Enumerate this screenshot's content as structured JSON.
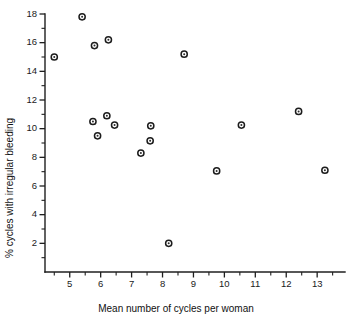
{
  "chart_data": {
    "type": "scatter",
    "title": "",
    "xlabel": "Mean number of cycles per woman",
    "ylabel": "% cycles with irregular bleeding",
    "xlim": [
      4.2,
      13.9
    ],
    "ylim": [
      0,
      18
    ],
    "grid": false,
    "legend": "none",
    "marker": "open-circle",
    "x_ticks_major": [
      5,
      6,
      7,
      8,
      9,
      10,
      11,
      12,
      13
    ],
    "x_tick_labels": [
      "5",
      "6",
      "7",
      "8",
      "9",
      "10",
      "11",
      "12",
      "13"
    ],
    "x_ticks_minor": [
      4.5,
      5.5,
      6.5,
      7.5,
      8.5,
      9.5,
      10.5,
      11.5,
      12.5,
      13.5
    ],
    "y_ticks_major": [
      2,
      4,
      6,
      8,
      10,
      12,
      14,
      16,
      18
    ],
    "y_tick_labels": [
      "2",
      "4",
      "6",
      "8",
      "10",
      "12",
      "14",
      "16",
      "18"
    ],
    "y_ticks_minor": [
      1,
      3,
      5,
      7,
      9,
      11,
      13,
      15,
      17
    ],
    "points": [
      {
        "x": 4.5,
        "y": 15.0
      },
      {
        "x": 5.4,
        "y": 17.8
      },
      {
        "x": 5.8,
        "y": 15.8
      },
      {
        "x": 6.25,
        "y": 16.2
      },
      {
        "x": 5.75,
        "y": 10.5
      },
      {
        "x": 5.9,
        "y": 9.5
      },
      {
        "x": 6.2,
        "y": 10.9
      },
      {
        "x": 6.45,
        "y": 10.25
      },
      {
        "x": 7.3,
        "y": 8.3
      },
      {
        "x": 7.6,
        "y": 9.15
      },
      {
        "x": 7.62,
        "y": 10.2
      },
      {
        "x": 8.2,
        "y": 2.0
      },
      {
        "x": 8.7,
        "y": 15.2
      },
      {
        "x": 9.75,
        "y": 7.05
      },
      {
        "x": 10.55,
        "y": 10.25
      },
      {
        "x": 12.4,
        "y": 11.2
      },
      {
        "x": 13.25,
        "y": 7.1
      }
    ]
  },
  "colors": {
    "axis": "#1f1f1f",
    "marker": "#1c1c1c",
    "background": "#ffffff"
  }
}
